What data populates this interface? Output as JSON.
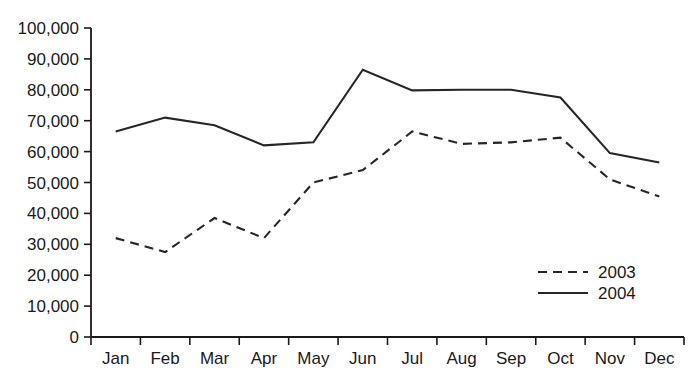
{
  "chart_data": {
    "type": "line",
    "title": "",
    "subtitle": "",
    "xlabel": "",
    "ylabel": "",
    "categories": [
      "Jan",
      "Feb",
      "Mar",
      "Apr",
      "May",
      "Jun",
      "Jul",
      "Aug",
      "Sep",
      "Oct",
      "Nov",
      "Dec"
    ],
    "series": [
      {
        "name": "2003",
        "style": "dashed",
        "color": "#262626",
        "values": [
          32000,
          27500,
          38500,
          32000,
          50000,
          54000,
          66500,
          62500,
          63000,
          64500,
          51000,
          45500
        ]
      },
      {
        "name": "2004",
        "style": "solid",
        "color": "#262626",
        "values": [
          66500,
          71000,
          68500,
          62000,
          63000,
          86500,
          79800,
          80000,
          80000,
          77500,
          59500,
          56500
        ]
      }
    ],
    "ylim": [
      0,
      100000
    ],
    "y_ticks": [
      0,
      10000,
      20000,
      30000,
      40000,
      50000,
      60000,
      70000,
      80000,
      90000,
      100000
    ],
    "y_tick_labels": [
      "0",
      "10,000",
      "20,000",
      "30,000",
      "40,000",
      "50,000",
      "60,000",
      "70,000",
      "80,000",
      "90,000",
      "100,000"
    ],
    "grid": false,
    "legend_position": "bottom-right",
    "legend_entries": [
      "2003",
      "2004"
    ]
  }
}
